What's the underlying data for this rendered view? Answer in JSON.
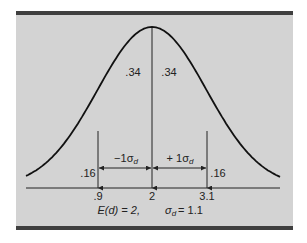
{
  "chart_data": {
    "type": "line",
    "title": "",
    "subtitle": "",
    "distribution": {
      "mean": 2,
      "sd": 1.1
    },
    "x_ticks": [
      ".9",
      "2",
      "3.1"
    ],
    "x_tick_values": [
      0.9,
      2,
      3.1
    ],
    "area_labels": [
      {
        "region": "below -1σ",
        "label": ".16",
        "value": 0.16
      },
      {
        "region": "-1σ to mean",
        "label": ".34",
        "value": 0.34
      },
      {
        "region": "mean to +1σ",
        "label": ".34",
        "value": 0.34
      },
      {
        "region": "above +1σ",
        "label": ".16",
        "value": 0.16
      }
    ],
    "interval_labels": {
      "minus": "−1σ",
      "minus_sub": "d",
      "plus": "+ 1σ",
      "plus_sub": "d"
    },
    "caption": {
      "mean_text": "E(d) = 2,",
      "sd_text": "σ",
      "sd_sub": "d",
      "sd_value": "= 1.1"
    },
    "grid": false,
    "legend": false,
    "xlabel": "",
    "ylabel": ""
  },
  "colors": {
    "background": "#d3d3d3",
    "bars": "#3f3f3f",
    "ink": "#222222"
  }
}
